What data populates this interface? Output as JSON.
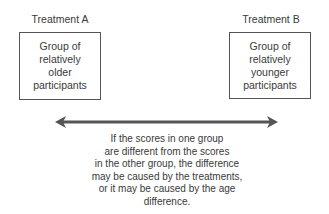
{
  "diagram": {
    "left": {
      "treatment_label": "Treatment A",
      "group_text": "Group of\nrelatively\nolder\nparticipants"
    },
    "right": {
      "treatment_label": "Treatment B",
      "group_text": "Group of\nrelatively\nyounger\nparticipants"
    },
    "connector": {
      "type": "double-headed-arrow",
      "color": "#555555"
    },
    "caption": "If the scores in one group\nare different from the scores\nin the other group, the difference\nmay be caused by the treatments,\nor it may be caused by the age\ndifference."
  }
}
